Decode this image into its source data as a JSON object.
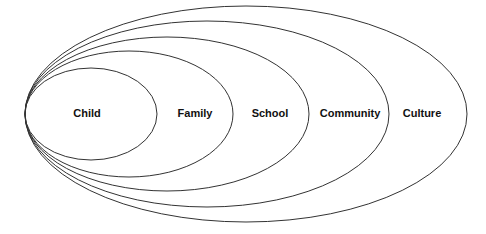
{
  "diagram": {
    "type": "nested-ellipses",
    "stroke_color": "#333333",
    "layers": [
      {
        "label": "Child",
        "rx": 66,
        "ry": 46,
        "label_x": 87,
        "label_y": 113
      },
      {
        "label": "Family",
        "rx": 104,
        "ry": 63,
        "label_x": 195,
        "label_y": 113
      },
      {
        "label": "School",
        "rx": 142,
        "ry": 77,
        "label_x": 270,
        "label_y": 113
      },
      {
        "label": "Community",
        "rx": 182,
        "ry": 93,
        "label_x": 350,
        "label_y": 113
      },
      {
        "label": "Culture",
        "rx": 221,
        "ry": 108,
        "label_x": 422,
        "label_y": 113
      }
    ]
  }
}
